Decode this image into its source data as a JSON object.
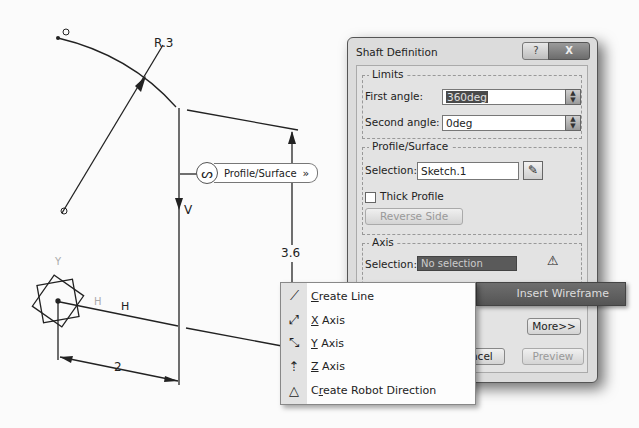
{
  "sketch": {
    "labels": {
      "radius": "R.3",
      "vertical": "V",
      "horizontal": "H",
      "dim_horizontal": "2",
      "dim_vertical": "3.6",
      "axis_y": "Y",
      "axis_h": "H"
    },
    "profile_tag": {
      "icon": "profile-circle-icon",
      "label": "Profile/Surface",
      "chevron": "»"
    }
  },
  "dialog": {
    "title": "Shaft Definition",
    "help_label": "?",
    "close_label": "X",
    "limits": {
      "group_title": "Limits",
      "first_angle_label": "First angle:",
      "first_angle_value": "360deg",
      "second_angle_label": "Second angle:",
      "second_angle_value": "0deg"
    },
    "profile": {
      "group_title": "Profile/Surface",
      "selection_label": "Selection:",
      "selection_value": "Sketch.1",
      "thick_profile_label": "Thick Profile",
      "thick_profile_checked": false,
      "reverse_side_label": "Reverse Side"
    },
    "axis": {
      "group_title": "Axis",
      "selection_label": "Selection:",
      "selection_value": "No selection"
    },
    "more_label": "More>>",
    "cancel_label": "Cancel",
    "cancel_visible": "cel",
    "preview_label": "Preview"
  },
  "insert_wireframe": {
    "label": "Insert Wireframe"
  },
  "context_menu": {
    "items": [
      {
        "icon": "line-icon",
        "mnemonic": "C",
        "rest": "reate Line",
        "label": "Create Line"
      },
      {
        "icon": "x-axis-icon",
        "mnemonic": "X",
        "rest": " Axis",
        "label": "X Axis"
      },
      {
        "icon": "y-axis-icon",
        "mnemonic": "Y",
        "rest": " Axis",
        "label": "Y Axis"
      },
      {
        "icon": "z-axis-icon",
        "mnemonic": "Z",
        "rest": " Axis",
        "label": "Z Axis"
      },
      {
        "icon": "robot-direction-icon",
        "pre": "C",
        "mnemonic": "r",
        "rest": "eate Robot Direction",
        "label": "Create Robot Direction"
      }
    ]
  }
}
